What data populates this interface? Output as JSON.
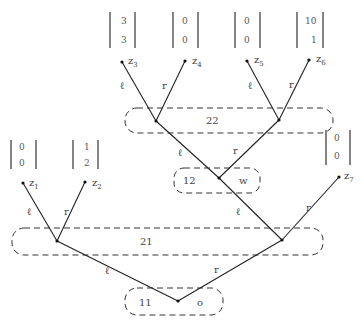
{
  "diagram": {
    "type": "game-tree",
    "information_sets": [
      {
        "id": "11",
        "label": "11",
        "extra": "o"
      },
      {
        "id": "21",
        "label": "21"
      },
      {
        "id": "22",
        "label": "22"
      },
      {
        "id": "12",
        "label": "12",
        "extra": "w"
      }
    ],
    "edge_labels": {
      "left": "ℓ",
      "right": "r"
    },
    "terminals": [
      {
        "name": "z",
        "sub": "1",
        "payoff": [
          "0",
          "0"
        ]
      },
      {
        "name": "z",
        "sub": "2",
        "payoff": [
          "1",
          "2"
        ]
      },
      {
        "name": "z",
        "sub": "3",
        "payoff": [
          "3",
          "3"
        ]
      },
      {
        "name": "z",
        "sub": "4",
        "payoff": [
          "0",
          "0"
        ]
      },
      {
        "name": "z",
        "sub": "5",
        "payoff": [
          "0",
          "0"
        ]
      },
      {
        "name": "z",
        "sub": "6",
        "payoff": [
          "10",
          "1"
        ]
      },
      {
        "name": "z",
        "sub": "7",
        "payoff": [
          "0",
          "0"
        ]
      }
    ]
  }
}
